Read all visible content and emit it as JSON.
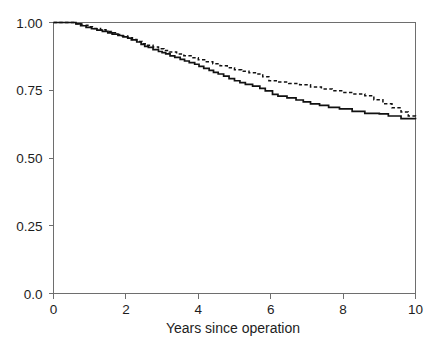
{
  "figure": {
    "background_color": "#ffffff",
    "axis_color": "#6e6e6e",
    "curve_color": "#111111"
  },
  "chart_data": {
    "type": "line",
    "subtype": "kaplan-meier-step",
    "title": "",
    "xlabel": "Years since operation",
    "ylabel": "",
    "xlim": [
      0,
      10
    ],
    "ylim": [
      0,
      1.0
    ],
    "xticks": [
      0,
      2,
      4,
      6,
      8,
      10
    ],
    "xticklabels": [
      "0",
      "2",
      "4",
      "6",
      "8",
      "10"
    ],
    "yticks": [
      0.0,
      0.25,
      0.5,
      0.75,
      1.0
    ],
    "yticklabels": [
      "0.0",
      "0.25",
      "0.50",
      "0.75",
      "1.00"
    ],
    "grid": false,
    "legend": null,
    "legend_position": "none",
    "spines": [
      "left",
      "bottom",
      "top",
      "right"
    ],
    "series": [
      {
        "name": "solid-curve",
        "style": "solid",
        "color": "#111111",
        "x": [
          0.0,
          0.45,
          0.62,
          0.75,
          0.9,
          1.05,
          1.2,
          1.35,
          1.5,
          1.62,
          1.78,
          1.92,
          2.05,
          2.15,
          2.3,
          2.42,
          2.52,
          2.62,
          2.75,
          2.9,
          3.0,
          3.1,
          3.22,
          3.35,
          3.5,
          3.62,
          3.75,
          3.9,
          4.02,
          4.15,
          4.3,
          4.42,
          4.55,
          4.7,
          4.85,
          5.0,
          5.15,
          5.3,
          5.5,
          5.7,
          5.85,
          6.05,
          6.2,
          6.45,
          6.7,
          6.9,
          7.1,
          7.35,
          7.6,
          7.9,
          8.25,
          8.6,
          9.0,
          9.25,
          9.6,
          10.0
        ],
        "y": [
          1.0,
          1.0,
          0.995,
          0.988,
          0.982,
          0.977,
          0.972,
          0.967,
          0.962,
          0.957,
          0.952,
          0.947,
          0.942,
          0.936,
          0.928,
          0.919,
          0.912,
          0.908,
          0.9,
          0.893,
          0.889,
          0.884,
          0.877,
          0.871,
          0.864,
          0.858,
          0.852,
          0.846,
          0.838,
          0.831,
          0.823,
          0.816,
          0.81,
          0.802,
          0.793,
          0.785,
          0.778,
          0.772,
          0.765,
          0.757,
          0.748,
          0.735,
          0.728,
          0.722,
          0.714,
          0.707,
          0.7,
          0.694,
          0.687,
          0.681,
          0.672,
          0.665,
          0.663,
          0.655,
          0.645,
          0.643
        ]
      },
      {
        "name": "dashed-curve",
        "style": "dashed",
        "color": "#111111",
        "x": [
          0.0,
          0.42,
          0.6,
          0.78,
          0.95,
          1.12,
          1.3,
          1.45,
          1.6,
          1.75,
          1.9,
          2.05,
          2.18,
          2.3,
          2.45,
          2.6,
          2.75,
          2.9,
          3.05,
          3.2,
          3.4,
          3.6,
          3.8,
          4.0,
          4.2,
          4.4,
          4.6,
          4.8,
          5.0,
          5.2,
          5.4,
          5.6,
          5.78,
          5.95,
          6.2,
          6.5,
          6.8,
          7.1,
          7.4,
          7.7,
          8.0,
          8.3,
          8.6,
          8.85,
          9.1,
          9.35,
          9.6,
          9.8,
          10.0
        ],
        "y": [
          1.0,
          1.0,
          0.995,
          0.99,
          0.984,
          0.978,
          0.973,
          0.967,
          0.962,
          0.956,
          0.95,
          0.944,
          0.937,
          0.93,
          0.922,
          0.916,
          0.91,
          0.903,
          0.897,
          0.891,
          0.884,
          0.877,
          0.87,
          0.863,
          0.855,
          0.848,
          0.84,
          0.833,
          0.826,
          0.82,
          0.815,
          0.81,
          0.8,
          0.785,
          0.78,
          0.775,
          0.77,
          0.762,
          0.755,
          0.748,
          0.742,
          0.736,
          0.73,
          0.715,
          0.7,
          0.685,
          0.67,
          0.655,
          0.645
        ]
      }
    ]
  }
}
